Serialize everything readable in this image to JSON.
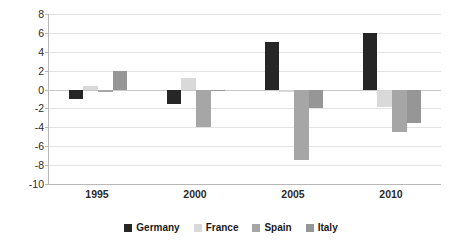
{
  "chart_data": {
    "type": "bar",
    "title": "",
    "subtitle": "",
    "xlabel": "",
    "ylabel": "",
    "categories": [
      "1995",
      "2000",
      "2005",
      "2010"
    ],
    "ylim": [
      -10,
      8
    ],
    "yticks": [
      "8",
      "6",
      "4",
      "2",
      "0",
      "-2",
      "-4",
      "-6",
      "-8",
      "-10"
    ],
    "ytick_values": [
      8,
      6,
      4,
      2,
      0,
      -2,
      -4,
      -6,
      -8,
      -10
    ],
    "grid": true,
    "legend_position": "bottom-center",
    "orientation": "vertical",
    "series": [
      {
        "name": "Germany",
        "color": "#262626",
        "values": [
          -1.0,
          -1.5,
          5.0,
          6.0
        ]
      },
      {
        "name": "France",
        "color": "#d9d9d9",
        "values": [
          0.4,
          1.2,
          -0.3,
          -1.8
        ]
      },
      {
        "name": "Spain",
        "color": "#a6a6a6",
        "values": [
          -0.3,
          -4.0,
          -7.5,
          -4.5
        ]
      },
      {
        "name": "Italy",
        "color": "#969696",
        "values": [
          2.0,
          -0.2,
          -2.0,
          -3.5
        ]
      }
    ]
  },
  "legend": {
    "items": [
      {
        "label": "Germany",
        "color": "#262626"
      },
      {
        "label": "France",
        "color": "#d9d9d9"
      },
      {
        "label": "Spain",
        "color": "#a6a6a6"
      },
      {
        "label": "Italy",
        "color": "#969696"
      }
    ]
  },
  "colors": {
    "background": "#ffffff",
    "gridline": "#e3e3e3",
    "axis": "#b8b8b8",
    "text": "#2b2b2b"
  }
}
